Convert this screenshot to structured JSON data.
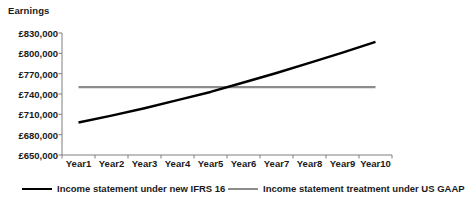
{
  "chart_data": {
    "type": "line",
    "title": "",
    "ylabel": "Earnings",
    "xlabel": "",
    "grid": false,
    "legend_position": "bottom",
    "ylim": [
      650000,
      830000
    ],
    "ytick_step": 30000,
    "ytick_labels": [
      "£830,000",
      "£800,000",
      "£770,000",
      "£740,000",
      "£710,000",
      "£680,000",
      "£650,000"
    ],
    "ytick_values": [
      830000,
      800000,
      770000,
      740000,
      710000,
      680000,
      650000
    ],
    "categories": [
      "Year1",
      "Year2",
      "Year3",
      "Year4",
      "Year5",
      "Year6",
      "Year7",
      "Year8",
      "Year9",
      "Year10"
    ],
    "series": [
      {
        "name": "Income statement under new IFRS 16",
        "color": "#000000",
        "values": [
          698000,
          708000,
          719000,
          731000,
          743000,
          757000,
          771000,
          786000,
          801000,
          817000
        ]
      },
      {
        "name": "Income statement treatment under US GAAP",
        "color": "#8c8c8c",
        "values": [
          750000,
          750000,
          750000,
          750000,
          750000,
          750000,
          750000,
          750000,
          750000,
          750000
        ]
      }
    ],
    "annotations": []
  },
  "legend": {
    "entries": [
      {
        "label": "Income statement under new IFRS 16",
        "swatch": "series-black"
      },
      {
        "label": "Income statement treatment under US GAAP",
        "swatch": "series-gray"
      }
    ]
  },
  "colors": {
    "axis": "#7f7f7f",
    "text": "#1a1a1a",
    "series_primary": "#000000",
    "series_secondary": "#8c8c8c",
    "background": "#ffffff"
  }
}
